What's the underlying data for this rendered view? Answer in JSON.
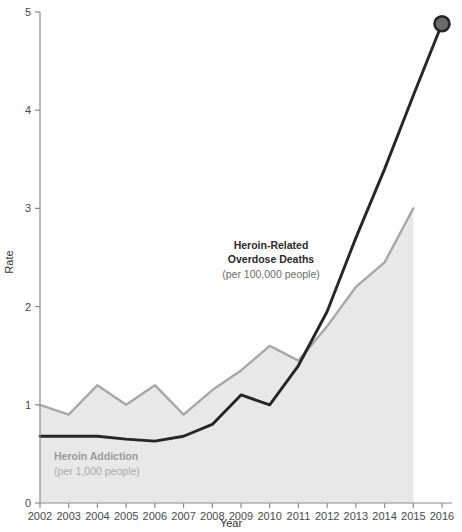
{
  "chart_data": {
    "type": "line",
    "title": "",
    "xlabel": "Year",
    "ylabel": "Rate",
    "x": [
      2002,
      2003,
      2004,
      2005,
      2006,
      2007,
      2008,
      2009,
      2010,
      2011,
      2012,
      2013,
      2014,
      2015,
      2016
    ],
    "xlim": [
      2002,
      2016
    ],
    "ylim": [
      0,
      5
    ],
    "xticks": [
      "2002",
      "2003",
      "2004",
      "2005",
      "2006",
      "2007",
      "2008",
      "2009",
      "2010",
      "2011",
      "2012",
      "2013",
      "2014",
      "2015",
      "2016"
    ],
    "yticks": [
      "0",
      "1",
      "2",
      "3",
      "4",
      "5"
    ],
    "grid": false,
    "legend_position": "inline-annotations",
    "series": [
      {
        "name": "Heroin Addiction",
        "style": "area",
        "unit": "per 1,000 people",
        "color": "#a8a8a8",
        "fill": "#e8e8e8",
        "x": [
          2002,
          2003,
          2004,
          2005,
          2006,
          2007,
          2008,
          2009,
          2010,
          2011,
          2012,
          2013,
          2014,
          2015
        ],
        "values": [
          1.0,
          0.9,
          1.2,
          1.0,
          1.2,
          0.9,
          1.15,
          1.35,
          1.6,
          1.45,
          1.8,
          2.2,
          2.45,
          3.0
        ]
      },
      {
        "name": "Heroin-Related Overdose Deaths",
        "style": "line",
        "unit": "per 100,000 people",
        "color": "#262626",
        "marker_at_end": true,
        "marker_fill": "#6b6b6b",
        "x": [
          2002,
          2003,
          2004,
          2005,
          2006,
          2007,
          2008,
          2009,
          2010,
          2011,
          2012,
          2013,
          2014,
          2015,
          2016
        ],
        "values": [
          0.68,
          0.68,
          0.68,
          0.65,
          0.63,
          0.68,
          0.8,
          1.1,
          1.0,
          1.4,
          1.95,
          2.7,
          3.4,
          4.15,
          4.88
        ]
      }
    ],
    "annotations": [
      {
        "id": "overdose-label",
        "line1": "Heroin-Related",
        "line2": "Overdose Deaths",
        "line3": "(per 100,000 people)"
      },
      {
        "id": "addiction-label",
        "line1": "Heroin Addiction",
        "line2": "(per 1,000 people)"
      }
    ]
  }
}
